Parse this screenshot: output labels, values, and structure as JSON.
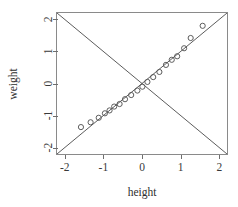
{
  "chart_data": {
    "type": "scatter",
    "title": "",
    "xlabel": "height",
    "ylabel": "weight",
    "xlim": [
      -2.2,
      2.2
    ],
    "ylim": [
      -2.2,
      2.2
    ],
    "grid": false,
    "legend": null,
    "xticks": [
      -2,
      -1,
      0,
      1,
      2
    ],
    "xticklabels": [
      "-2",
      "-1",
      "0",
      "1",
      "2"
    ],
    "yticks": [
      -2,
      -1,
      0,
      1,
      2
    ],
    "yticklabels": [
      "-2",
      "-1",
      "0",
      "1",
      "2"
    ],
    "point_marker": "open-circle",
    "points": [
      {
        "x": -1.58,
        "y": -1.36
      },
      {
        "x": -1.33,
        "y": -1.21
      },
      {
        "x": -1.12,
        "y": -1.07
      },
      {
        "x": -0.96,
        "y": -0.93
      },
      {
        "x": -0.84,
        "y": -0.84
      },
      {
        "x": -0.72,
        "y": -0.72
      },
      {
        "x": -0.58,
        "y": -0.64
      },
      {
        "x": -0.44,
        "y": -0.49
      },
      {
        "x": -0.28,
        "y": -0.36
      },
      {
        "x": -0.12,
        "y": -0.22
      },
      {
        "x": 0.01,
        "y": -0.1
      },
      {
        "x": 0.14,
        "y": 0.05
      },
      {
        "x": 0.29,
        "y": 0.2
      },
      {
        "x": 0.45,
        "y": 0.36
      },
      {
        "x": 0.62,
        "y": 0.58
      },
      {
        "x": 0.77,
        "y": 0.74
      },
      {
        "x": 0.91,
        "y": 0.85
      },
      {
        "x": 1.09,
        "y": 1.1
      },
      {
        "x": 1.26,
        "y": 1.42
      },
      {
        "x": 1.57,
        "y": 1.8
      }
    ],
    "reference_lines": [
      {
        "name": "identity-line",
        "slope": 1,
        "intercept": 0
      },
      {
        "name": "anti-diagonal-line",
        "slope": -1,
        "intercept": 0
      }
    ],
    "colors": {
      "point_stroke": "#555555",
      "reference_line": "#4a4a4a",
      "frame": "#8a8a8a",
      "text": "#2e2e2e",
      "background": "#ffffff"
    }
  },
  "labels": {
    "x_axis_title": "height",
    "y_axis_title": "weight"
  }
}
